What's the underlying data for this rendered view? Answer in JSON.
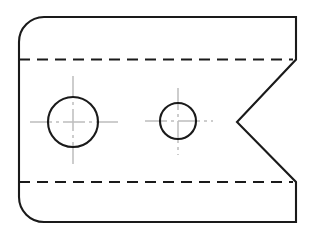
{
  "drawing": {
    "title": "Orthographic Front View — Notched Plate with Two Holes",
    "view_label": "front-view",
    "canvas": {
      "width": 310,
      "height": 239,
      "background": "#ffffff"
    },
    "colors": {
      "visible_edge": "#1a1a1a",
      "hidden_edge": "#1a1a1a",
      "center_line": "#bdbdbd",
      "fill": "#ffffff"
    },
    "line_weights": {
      "visible_edge": 2.1,
      "hidden_edge": 1.9,
      "center_line": 1.5
    },
    "outline": {
      "name": "plate-outline",
      "description": "Rectangular plate with rounded left corners and a V-notch on the right edge",
      "path": "M 44 17 L 296 17 L 296 59.5 L 237 122 L 296 182 L 296 222 L 44 222 A 25 25 0 0 1 19 197 L 19 42 A 25 25 0 0 1 44 17 Z",
      "bounds": {
        "left": 19,
        "top": 17,
        "right": 296,
        "bottom": 222
      },
      "corner_radius": 25,
      "rounded_corners": [
        "top-left",
        "bottom-left"
      ],
      "sharp_corners": [
        "top-right",
        "bottom-right"
      ]
    },
    "notch": {
      "name": "v-notch",
      "shape": "vee",
      "upper_point": {
        "x": 296,
        "y": 59.5
      },
      "vertex": {
        "x": 237,
        "y": 122
      },
      "lower_point": {
        "x": 296,
        "y": 182
      },
      "depth": 59
    },
    "holes": [
      {
        "name": "large-hole",
        "cx": 73,
        "cy": 122,
        "r": 25,
        "centerline_h": {
          "x1": 30,
          "x2": 118,
          "y": 122
        },
        "centerline_v": {
          "y1": 76,
          "y2": 168,
          "x": 73
        }
      },
      {
        "name": "small-hole",
        "cx": 178,
        "cy": 121,
        "r": 18,
        "centerline_h": {
          "x1": 145,
          "x2": 213,
          "y": 121
        },
        "centerline_v": {
          "y1": 88,
          "y2": 155,
          "x": 178
        }
      }
    ],
    "hidden_lines": [
      {
        "name": "upper-hidden-line",
        "x1": 19,
        "x2": 293,
        "y": 59.5,
        "dash_pattern": "11 7"
      },
      {
        "name": "lower-hidden-line",
        "x1": 19,
        "x2": 293,
        "y": 182,
        "dash_pattern": "11 7"
      }
    ],
    "center_line_dash": "22 4 3 4"
  }
}
